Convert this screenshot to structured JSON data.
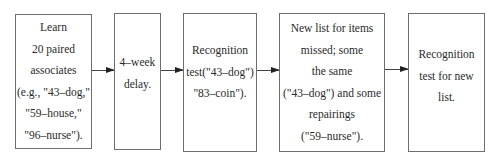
{
  "diagram": {
    "type": "flowchart",
    "direction": "left-to-right",
    "steps": [
      {
        "id": "learn",
        "lines": [
          "Learn",
          "20 paired",
          "associates",
          "(e.g., \"43–dog,\"",
          "\"59–house,\"",
          "\"96–nurse\")."
        ]
      },
      {
        "id": "delay",
        "lines": [
          "4–week",
          "delay."
        ]
      },
      {
        "id": "test1",
        "lines": [
          "Recognition",
          "test(\"43–dog\")",
          "\"83–coin\")."
        ]
      },
      {
        "id": "newlist",
        "lines": [
          "New list for items",
          "missed; some",
          "the same",
          "(\"43–dog\") and some",
          "repairings",
          "(\"59–nurse\")."
        ]
      },
      {
        "id": "test2",
        "lines": [
          "Recognition",
          "test for new",
          "list."
        ]
      }
    ],
    "edges": [
      {
        "from": "learn",
        "to": "delay"
      },
      {
        "from": "delay",
        "to": "test1"
      },
      {
        "from": "test1",
        "to": "newlist"
      },
      {
        "from": "newlist",
        "to": "test2"
      }
    ]
  }
}
